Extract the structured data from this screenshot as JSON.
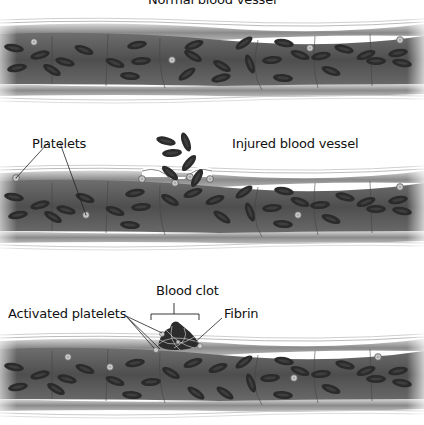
{
  "panels": [
    {
      "id": "normal",
      "title": "Normal blood vessel",
      "vessel": {
        "top": 20,
        "bottom": 100
      }
    },
    {
      "id": "injured",
      "title": "Injured blood vessel",
      "labels": {
        "platelets": "Platelets"
      },
      "vessel": {
        "top": 170,
        "bottom": 255
      }
    },
    {
      "id": "clot",
      "title": "Blood clot",
      "labels": {
        "activated_platelets": "Activated platelets",
        "fibrin": "Fibrin"
      },
      "vessel": {
        "top": 335,
        "bottom": 420
      }
    }
  ],
  "colors": {
    "vessel_lumen": "#5a5a5a",
    "vessel_wall": "#9a9a9a",
    "red_cell": "#2a2a2a",
    "platelet": "#c8c8c8",
    "text": "#111111"
  }
}
